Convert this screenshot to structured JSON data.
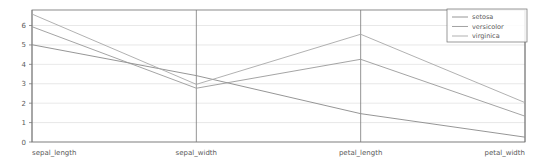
{
  "chart_data": {
    "type": "line",
    "subtype": "parallel-coordinates",
    "title": "",
    "xlabel": "",
    "ylabel": "",
    "categories": [
      "sepal_length",
      "sepal_width",
      "petal_length",
      "petal_width"
    ],
    "ylim": [
      0,
      6.8
    ],
    "yticks": [
      0,
      1,
      2,
      3,
      4,
      5,
      6
    ],
    "ytick_labels": [
      "0",
      "1",
      "2",
      "3",
      "4",
      "5",
      "6"
    ],
    "grid": true,
    "grid_axis": "y",
    "legend_position": "upper right",
    "series": [
      {
        "name": "setosa",
        "color": "#8a8a8a",
        "values": [
          5.01,
          3.42,
          1.46,
          0.25
        ]
      },
      {
        "name": "versicolor",
        "color": "#9a9a9a",
        "values": [
          5.94,
          2.77,
          4.26,
          1.33
        ]
      },
      {
        "name": "virginica",
        "color": "#a8a8a8",
        "values": [
          6.59,
          2.97,
          5.55,
          2.03
        ]
      }
    ]
  },
  "axes": {
    "tick_labels": [
      "6",
      "5",
      "4",
      "3",
      "2",
      "1",
      "0"
    ],
    "category_labels": [
      "sepal_length",
      "sepal_width",
      "petal_length",
      "petal_width"
    ]
  },
  "legend": {
    "entries": [
      {
        "label": "setosa"
      },
      {
        "label": "versicolor"
      },
      {
        "label": "virginica"
      }
    ]
  },
  "colors": {
    "axis": "#7a7a7a",
    "grid": "#d8d8d8",
    "border": "#6e6e6e",
    "text": "#5a5a5a",
    "background": "#ffffff"
  }
}
